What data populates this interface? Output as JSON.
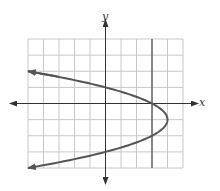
{
  "chart_data": {
    "type": "line",
    "title": "",
    "xlabel": "x",
    "ylabel": "y",
    "xlim": [
      -5,
      5
    ],
    "ylim": [
      -4,
      4
    ],
    "grid": true,
    "grid_step": 1,
    "series": [
      {
        "name": "x = 4 - (y + 1)^2",
        "kind": "parabola-horizontal",
        "vertex": [
          4,
          -1
        ],
        "points": [
          [
            -5,
            2
          ],
          [
            0,
            1
          ],
          [
            3,
            0
          ],
          [
            4,
            -1
          ],
          [
            3,
            -2
          ],
          [
            0,
            -3
          ],
          [
            -5,
            -4
          ]
        ],
        "arrows": "both-ends",
        "color": "#555555"
      },
      {
        "name": "vertical line x = 3",
        "kind": "vertical-line",
        "x": 3,
        "color": "#555555"
      }
    ]
  },
  "axes": {
    "x_label": "x",
    "y_label": "y"
  },
  "colors": {
    "grid": "#c8c8c8",
    "axis": "#333333",
    "curve": "#555555"
  }
}
